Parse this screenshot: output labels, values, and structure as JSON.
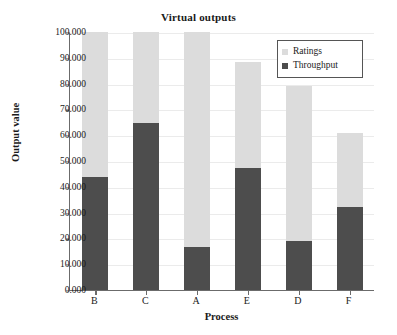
{
  "chart_data": {
    "type": "bar",
    "stacked": true,
    "title": "Virtual outputs",
    "xlabel": "Process",
    "ylabel": "Output value",
    "categories": [
      "B",
      "C",
      "A",
      "E",
      "D",
      "F"
    ],
    "series": [
      {
        "name": "Throughput",
        "color": "#4d4d4d",
        "values": [
          43.8,
          64.7,
          16.7,
          47.3,
          19.0,
          32.2
        ]
      },
      {
        "name": "Ratings",
        "color": "#dcdcdc",
        "values": [
          56.2,
          35.3,
          83.3,
          41.1,
          60.1,
          28.7
        ]
      }
    ],
    "totals": [
      100.0,
      100.0,
      100.0,
      88.4,
      79.1,
      60.9
    ],
    "ylim": [
      0,
      100
    ],
    "ytick_values": [
      0,
      10,
      20,
      30,
      40,
      50,
      60,
      70,
      80,
      90,
      100
    ],
    "ytick_labels": [
      "0.000",
      "10.000",
      "20.000",
      "30.000",
      "40.000",
      "50.000",
      "60.000",
      "70.000",
      "80.000",
      "90.000",
      "100.000"
    ],
    "grid": true,
    "legend_position": "top-right",
    "legend_entries": [
      "Ratings",
      "Throughput"
    ],
    "colors": {
      "ratings": "#dcdcdc",
      "throughput": "#4d4d4d",
      "axis": "#6b6b6b",
      "grid": "#ebebeb",
      "background": "#ffffff",
      "text": "#1a1a1a"
    }
  }
}
